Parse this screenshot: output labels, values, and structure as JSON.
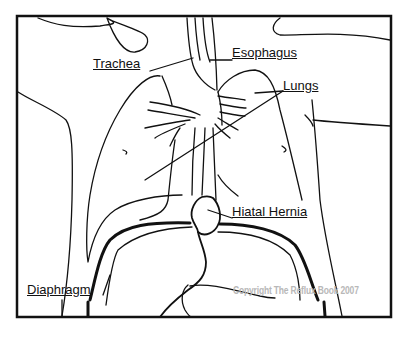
{
  "diagram": {
    "labels": {
      "trachea": "Trachea",
      "esophagus": "Esophagus",
      "lungs": "Lungs",
      "hiatal_hernia": "Hiatal Hernia",
      "diaphragm": "Diaphragm"
    },
    "copyright": "Copyright The Reflux Book 2007",
    "colors": {
      "stroke": "#111111",
      "background": "#ffffff",
      "copyright": "#b8b8b8"
    }
  }
}
